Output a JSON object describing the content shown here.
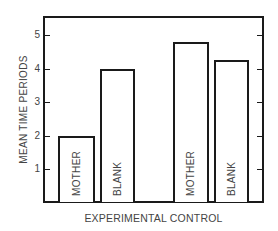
{
  "chart_data": {
    "type": "bar",
    "title": "",
    "xlabel": "EXPERIMENTAL CONTROL",
    "ylabel": "MEAN TIME PERIODS",
    "categories": [
      "MOTHER",
      "BLANK",
      "MOTHER",
      "BLANK"
    ],
    "groups": [
      "EXPERIMENTAL",
      "CONTROL"
    ],
    "values": [
      2.0,
      4.0,
      4.8,
      4.25
    ],
    "ylim": [
      0,
      5.5
    ],
    "yticks": [
      1,
      2,
      3,
      4,
      5
    ],
    "grid": false,
    "legend": null,
    "bar_labels_inside": true
  },
  "axis": {
    "yticks": [
      "1",
      "2",
      "3",
      "4",
      "5"
    ],
    "ylabel": "MEAN TIME PERIODS",
    "xlabel": "EXPERIMENTAL CONTROL"
  },
  "bars": [
    {
      "label": "MOTHER",
      "value": 2.0
    },
    {
      "label": "BLANK",
      "value": 4.0
    },
    {
      "label": "MOTHER",
      "value": 4.8
    },
    {
      "label": "BLANK",
      "value": 4.25
    }
  ],
  "colors": {
    "line": "#1a1a1a",
    "text": "#444444",
    "background": "#ffffff"
  }
}
